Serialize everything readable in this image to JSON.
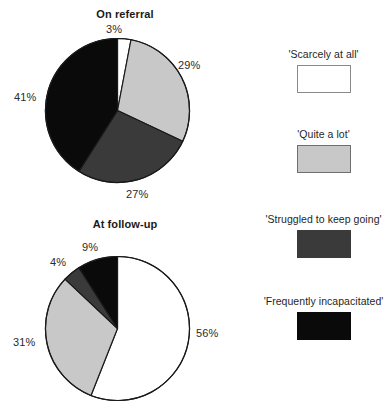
{
  "chart_data": [
    {
      "type": "pie",
      "title": "On referral",
      "categories": [
        "'Scarcely at all'",
        "'Quite a lot'",
        "'Struggled to keep going'",
        "'Frequently incapacitated'"
      ],
      "values": [
        3,
        29,
        27,
        41
      ],
      "labels": [
        "3%",
        "29%",
        "27%",
        "41%"
      ],
      "colors": [
        "#ffffff",
        "#c8c8c8",
        "#3a3a3a",
        "#0a0a0a"
      ],
      "start_angle_deg": 0,
      "direction": "clockwise",
      "units": "percent",
      "legend_position": "right"
    },
    {
      "type": "pie",
      "title": "At follow-up",
      "categories": [
        "'Scarcely at all'",
        "'Quite a lot'",
        "'Struggled to keep going'",
        "'Frequently incapacitated'"
      ],
      "values": [
        56,
        31,
        4,
        9
      ],
      "labels": [
        "56%",
        "31%",
        "4%",
        "9%"
      ],
      "colors": [
        "#ffffff",
        "#c8c8c8",
        "#3a3a3a",
        "#0a0a0a"
      ],
      "start_angle_deg": 0,
      "direction": "clockwise",
      "units": "percent",
      "legend_position": "right"
    }
  ],
  "charts": {
    "referral": {
      "title": "On referral",
      "slices": [
        {
          "label": "3%",
          "value": 3,
          "color": "#ffffff"
        },
        {
          "label": "29%",
          "value": 29,
          "color": "#c8c8c8"
        },
        {
          "label": "27%",
          "value": 27,
          "color": "#3a3a3a"
        },
        {
          "label": "41%",
          "value": 41,
          "color": "#0a0a0a"
        }
      ]
    },
    "followup": {
      "title": "At follow-up",
      "slices": [
        {
          "label": "56%",
          "value": 56,
          "color": "#ffffff"
        },
        {
          "label": "31%",
          "value": 31,
          "color": "#c8c8c8"
        },
        {
          "label": "4%",
          "value": 4,
          "color": "#3a3a3a"
        },
        {
          "label": "9%",
          "value": 9,
          "color": "#0a0a0a"
        }
      ]
    }
  },
  "legend": {
    "items": [
      {
        "label": "'Scarcely at all'",
        "color": "#ffffff",
        "border": "#8a8a8a"
      },
      {
        "label": "'Quite a lot'",
        "color": "#c8c8c8",
        "border": "#6e6e6e"
      },
      {
        "label": "'Struggled to keep going'",
        "color": "#3a3a3a",
        "border": "#3a3a3a"
      },
      {
        "label": "'Frequently incapacitated'",
        "color": "#0a0a0a",
        "border": "#0a0a0a"
      }
    ]
  },
  "palette": {
    "outline": "#1a1a1a",
    "text": "#2b2b2b",
    "background": "#ffffff"
  }
}
